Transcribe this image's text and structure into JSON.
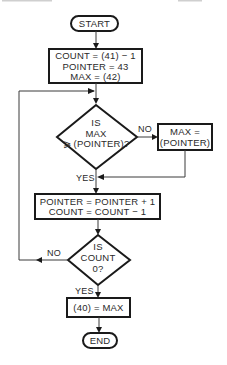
{
  "diagram": {
    "type": "flowchart",
    "colors": {
      "stroke": "#1a1a1a",
      "text": "#2a2a2a",
      "background": "#ffffff"
    },
    "nodes": {
      "start": {
        "label": "START",
        "shape": "terminal"
      },
      "init": {
        "shape": "process",
        "lines": [
          "COUNT = (41) − 1",
          "POINTER = 43",
          "MAX = (42)"
        ]
      },
      "decision_max": {
        "shape": "decision",
        "lines": [
          "IS",
          "MAX",
          "⩾ (POINTER)?"
        ]
      },
      "set_max": {
        "shape": "process",
        "lines": [
          "MAX =",
          "(POINTER)"
        ]
      },
      "increment": {
        "shape": "process",
        "lines": [
          "POINTER = POINTER + 1",
          "COUNT = COUNT − 1"
        ]
      },
      "decision_count": {
        "shape": "decision",
        "lines": [
          "IS",
          "COUNT",
          "0?"
        ]
      },
      "store": {
        "shape": "process",
        "label": "(40) = MAX"
      },
      "end": {
        "label": "END",
        "shape": "terminal"
      }
    },
    "edge_labels": {
      "max_no": "NO",
      "max_yes": "YES",
      "count_no": "NO",
      "count_yes": "YES"
    }
  }
}
